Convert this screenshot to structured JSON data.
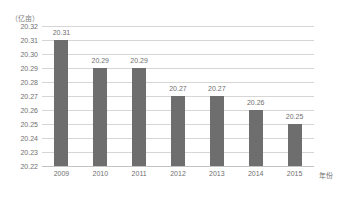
{
  "chart_data": {
    "type": "bar",
    "title": "",
    "subtitle": "",
    "unit_label": "（亿亩）",
    "xlabel": "年份",
    "ylabel": "",
    "categories": [
      "2009",
      "2010",
      "2011",
      "2012",
      "2013",
      "2014",
      "2015"
    ],
    "values": [
      20.31,
      20.29,
      20.29,
      20.27,
      20.27,
      20.26,
      20.25
    ],
    "data_labels": [
      "20.31",
      "20.29",
      "20.29",
      "20.27",
      "20.27",
      "20.26",
      "20.25"
    ],
    "ylim": [
      20.22,
      20.32
    ],
    "ytick_labels": [
      "20.32",
      "20.31",
      "20.30",
      "20.29",
      "20.28",
      "20.27",
      "20.26",
      "20.25",
      "20.24",
      "20.23",
      "20.22"
    ],
    "ytick_values": [
      20.32,
      20.31,
      20.3,
      20.29,
      20.28,
      20.27,
      20.26,
      20.25,
      20.24,
      20.23,
      20.22
    ],
    "grid": true,
    "legend": false,
    "legend_position": "none",
    "series": [
      {
        "name": "耕地面积",
        "values": [
          20.31,
          20.29,
          20.29,
          20.27,
          20.27,
          20.26,
          20.25
        ],
        "color": "#6e6e6e"
      }
    ],
    "colors": {
      "bar": "#6e6e6e",
      "gridline": "#d6d6d6",
      "axis": "#c2c2c2",
      "text": "#6f6f6f",
      "background": "#ffffff"
    }
  }
}
